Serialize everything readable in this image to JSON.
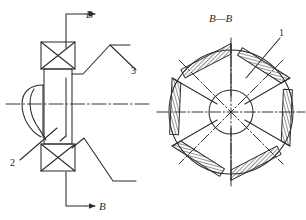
{
  "drawing": {
    "title": "Mechanical assembly drawing - elevation and B-B section",
    "type": "engineering-line-drawing",
    "background_color": "#ffffff",
    "line_color": "#2b2b2b",
    "hatch_color": "#2b2b2b"
  },
  "views": {
    "elevation": {
      "name": "left-elevation-view",
      "section_arrow_top_label": "B",
      "section_arrow_bottom_label": "B",
      "callout_upper_label": "3",
      "callout_lower_label": "2",
      "components": [
        {
          "name": "upper-bearing-symbol",
          "shape": "rectangle-with-cross"
        },
        {
          "name": "lower-bearing-symbol",
          "shape": "rectangle-with-cross"
        },
        {
          "name": "shaft-body",
          "shape": "vertical-rectangle"
        },
        {
          "name": "blade-profile",
          "shape": "curved-vane-profile"
        },
        {
          "name": "horizontal-centerline",
          "shape": "dash-dot-line"
        }
      ]
    },
    "section": {
      "name": "right-section-view",
      "title": "B—B",
      "callout_label": "1",
      "blade_count": 6,
      "components": [
        {
          "name": "outer-circle",
          "shape": "circle"
        },
        {
          "name": "hub-circle",
          "shape": "circle"
        },
        {
          "name": "radial-centerlines",
          "shape": "dash-dot-lines"
        },
        {
          "name": "blade-vane",
          "shape": "bent-L-hatched-vane"
        }
      ]
    }
  }
}
